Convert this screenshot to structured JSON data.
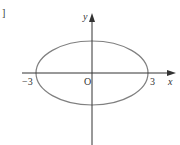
{
  "figure": {
    "type": "ellipse-on-axes",
    "corner_mark": "]",
    "axes": {
      "x_label": "x",
      "y_label": "y",
      "origin_label": "O"
    },
    "ellipse": {
      "x_intercepts": [
        "−3",
        "3"
      ],
      "center": [
        0,
        0
      ]
    },
    "colors": {
      "axis": "#333333",
      "curve": "#808080",
      "text": "#333333"
    }
  }
}
